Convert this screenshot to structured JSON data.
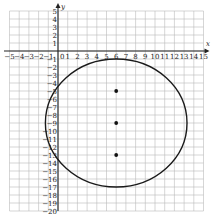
{
  "chart_data": {
    "type": "scatter",
    "title": "",
    "xlabel": "x",
    "ylabel": "y",
    "xlim": [
      -5,
      15
    ],
    "ylim": [
      -20,
      5
    ],
    "grid": true,
    "x_ticks": [
      -5,
      -4,
      -3,
      -2,
      -1,
      1,
      2,
      3,
      4,
      5,
      6,
      7,
      8,
      9,
      10,
      11,
      12,
      13,
      14,
      15
    ],
    "y_ticks": [
      5,
      4,
      3,
      2,
      1,
      -1,
      -2,
      -3,
      -4,
      -5,
      -6,
      -7,
      -8,
      -9,
      -10,
      -11,
      -12,
      -13,
      -14,
      -15,
      -16,
      -17,
      -18,
      -19,
      -20
    ],
    "origin_label": "0",
    "points": [
      {
        "x": 6,
        "y": -5
      },
      {
        "x": 6,
        "y": -9
      },
      {
        "x": 6,
        "y": -13
      }
    ],
    "circle": {
      "center": {
        "x": 6,
        "y": -9
      },
      "radius_x": 7.3,
      "radius_y": 8
    },
    "colors": {
      "grid": "#bbbbbb",
      "axis": "#222222",
      "curve": "#1a1a1a",
      "point": "#111111"
    }
  }
}
